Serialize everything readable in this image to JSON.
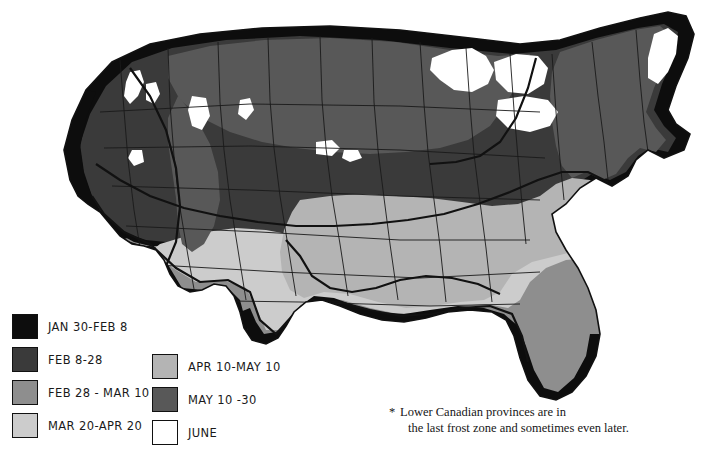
{
  "map": {
    "title": "Average Date of Last Spring Frost",
    "region": "United States",
    "background_color": "#ffffff",
    "outline_color": "#111111",
    "state_border_color": "#1a1a1a"
  },
  "palette": {
    "jan30_feb8": "#0d0d0d",
    "feb8_28": "#3a3a3a",
    "feb28_mar10": "#8e8e8e",
    "mar20_apr20": "#cccccc",
    "apr10_may10": "#b4b4b4",
    "may10_30": "#585858",
    "june": "#ffffff"
  },
  "legend": {
    "left_column": [
      {
        "label": "JAN 30-FEB 8",
        "color": "#0d0d0d",
        "swatch": "swatch-jan30-feb8"
      },
      {
        "label": "FEB 8-28",
        "color": "#3a3a3a",
        "swatch": "swatch-feb8-28"
      },
      {
        "label": "FEB 28 - MAR 10",
        "color": "#8e8e8e",
        "swatch": "swatch-feb28-mar10"
      },
      {
        "label": "MAR 20-APR 20",
        "color": "#cccccc",
        "swatch": "swatch-mar20-apr20"
      }
    ],
    "right_column": [
      {
        "label": "APR 10-MAY 10",
        "color": "#b4b4b4",
        "swatch": "swatch-apr10-may10"
      },
      {
        "label": "MAY 10 -30",
        "color": "#585858",
        "swatch": "swatch-may10-30"
      },
      {
        "label": "JUNE",
        "color": "#ffffff",
        "swatch": "swatch-june"
      }
    ]
  },
  "footnote": {
    "marker": "*",
    "line1": "Lower Canadian provinces are in",
    "line2": "the last frost zone and sometimes even later."
  }
}
